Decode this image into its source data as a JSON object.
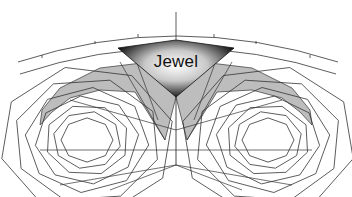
{
  "diagram": {
    "label": "Jewel",
    "colors": {
      "background": "#ffffff",
      "line": "#333333",
      "band_fill": "#bdbdbd",
      "jewel_dark": "#000000",
      "jewel_light": "#ffffff"
    },
    "jewel": {
      "apex_top": [
        176,
        40
      ],
      "left": [
        118,
        48
      ],
      "right": [
        234,
        48
      ],
      "bottom": [
        176,
        97
      ]
    },
    "center_line": {
      "x": 176,
      "y1": 12,
      "y2": 165
    },
    "eyes": [
      {
        "name": "left-eye",
        "cx": 87,
        "cy": 140,
        "rings": [
          26,
          34,
          42,
          52,
          62,
          74,
          88
        ]
      },
      {
        "name": "right-eye",
        "cx": 268,
        "cy": 140,
        "rings": [
          26,
          34,
          42,
          52,
          62,
          74,
          88
        ]
      }
    ]
  }
}
